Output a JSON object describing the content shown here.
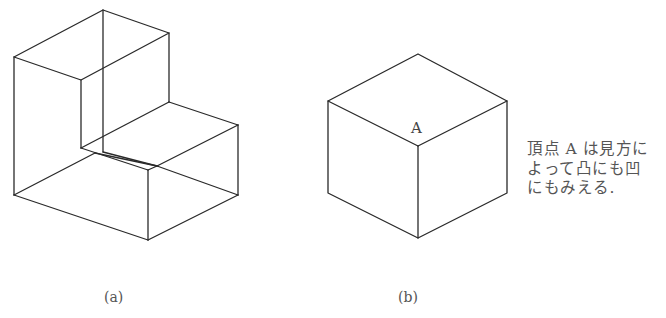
{
  "figure_a": {
    "caption": "(a)",
    "description": "L-shaped solid (wireframe isometric)"
  },
  "figure_b": {
    "caption": "(b)",
    "vertex_label": "A",
    "description": "Cube drawn in isometric view"
  },
  "note": {
    "lines": [
      "頂点 A は見方に",
      "よって凸にも凹",
      "にもみえる."
    ]
  },
  "colors": {
    "line": "#2a2a2a",
    "text": "#555555",
    "background": "#ffffff"
  }
}
